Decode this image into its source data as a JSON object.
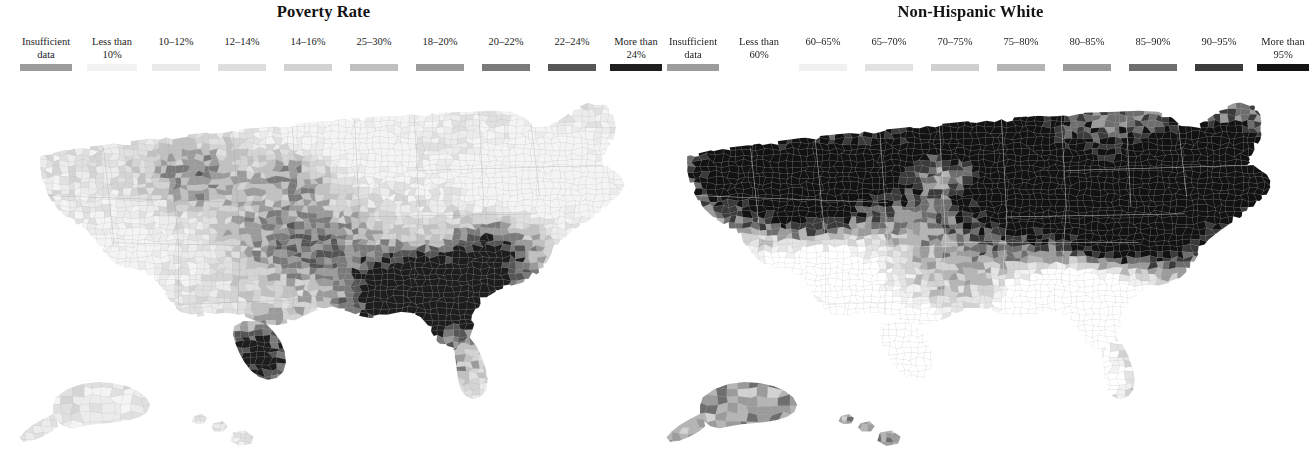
{
  "figure": {
    "width": 1294,
    "height": 449,
    "background": "#ffffff",
    "panel_count": 2
  },
  "panels": [
    {
      "id": "poverty-rate",
      "title": "Poverty Rate",
      "legend": {
        "items": [
          {
            "label": "Insufficient\ndata",
            "color": "#9c9c9c",
            "x": 46,
            "width": 78
          },
          {
            "label": "Less than\n10%",
            "color": "#f2f2f2",
            "x": 112,
            "width": 64
          },
          {
            "label": "10–12%",
            "color": "#eaeaea",
            "x": 176,
            "width": 62
          },
          {
            "label": "12–14%",
            "color": "#dedede",
            "x": 242,
            "width": 62
          },
          {
            "label": "14–16%",
            "color": "#d2d2d2",
            "x": 308,
            "width": 62
          },
          {
            "label": "25–30%",
            "color": "#c0c0c0",
            "x": 374,
            "width": 62
          },
          {
            "label": "18–20%",
            "color": "#9a9a9a",
            "x": 440,
            "width": 62
          },
          {
            "label": "20–22%",
            "color": "#7a7a7a",
            "x": 506,
            "width": 62
          },
          {
            "label": "22–24%",
            "color": "#565656",
            "x": 572,
            "width": 62
          },
          {
            "label": "More than\n24%",
            "color": "#1f1f1f",
            "x": 636,
            "width": 66
          }
        ]
      }
    },
    {
      "id": "non-hispanic-white",
      "title": "Non-Hispanic White",
      "legend": {
        "items": [
          {
            "label": "Insufficient\ndata",
            "color": "#9c9c9c",
            "x": 46,
            "width": 78
          },
          {
            "label": "Less than\n60%",
            "color": "#ffffff",
            "x": 112,
            "width": 64
          },
          {
            "label": "60–65%",
            "color": "#f0f0f0",
            "x": 176,
            "width": 62
          },
          {
            "label": "65–70%",
            "color": "#e2e2e2",
            "x": 242,
            "width": 62
          },
          {
            "label": "70–75%",
            "color": "#d0d0d0",
            "x": 308,
            "width": 62
          },
          {
            "label": "75–80%",
            "color": "#b4b4b4",
            "x": 374,
            "width": 62
          },
          {
            "label": "80–85%",
            "color": "#9a9a9a",
            "x": 440,
            "width": 62
          },
          {
            "label": "85–90%",
            "color": "#6e6e6e",
            "x": 506,
            "width": 62
          },
          {
            "label": "90–95%",
            "color": "#3c3c3c",
            "x": 572,
            "width": 62
          },
          {
            "label": "More than\n95%",
            "color": "#141414",
            "x": 636,
            "width": 66
          }
        ]
      }
    }
  ],
  "chart_data": {
    "type": "heatmap",
    "subtype": "choropleth-map-pair",
    "geography": "United States counties (contiguous 48 states plus Alaska and Hawaii insets)",
    "legend_position": "top, above each map",
    "grid": false,
    "maps": [
      {
        "name": "Poverty Rate",
        "variable": "poverty_rate_percent",
        "unit": "%",
        "value_range": [
          0,
          30
        ],
        "bins": [
          {
            "label": "Insufficient data",
            "color": "#9c9c9c",
            "share_of_counties": 0.005
          },
          {
            "label": "Less than 10%",
            "color": "#f2f2f2",
            "range": [
              0,
              10
            ],
            "share_of_counties": 0.17
          },
          {
            "label": "10–12%",
            "color": "#eaeaea",
            "range": [
              10,
              12
            ],
            "share_of_counties": 0.14
          },
          {
            "label": "12–14%",
            "color": "#dedede",
            "range": [
              12,
              14
            ],
            "share_of_counties": 0.15
          },
          {
            "label": "14–16%",
            "color": "#d2d2d2",
            "range": [
              14,
              16
            ],
            "share_of_counties": 0.14
          },
          {
            "label": "25–30%",
            "color": "#c0c0c0",
            "range": [
              25,
              30
            ],
            "share_of_counties": 0.12
          },
          {
            "label": "18–20%",
            "color": "#9a9a9a",
            "range": [
              18,
              20
            ],
            "share_of_counties": 0.1
          },
          {
            "label": "20–22%",
            "color": "#7a7a7a",
            "range": [
              20,
              22
            ],
            "share_of_counties": 0.07
          },
          {
            "label": "22–24%",
            "color": "#565656",
            "range": [
              22,
              24
            ],
            "share_of_counties": 0.05
          },
          {
            "label": "More than 24%",
            "color": "#1f1f1f",
            "range": [
              24,
              100
            ],
            "share_of_counties": 0.045
          }
        ],
        "spatial_pattern": "Light (low poverty) across the Upper Midwest, Great Plains, Northeast corridor and Mountain West; darker (high poverty) clusters in Appalachia, the Mississippi Delta, the Deep South Black Belt, south Texas along the Rio Grande, and Native American reservation counties in the Dakotas, Arizona and New Mexico.",
        "overall_tone": "light"
      },
      {
        "name": "Non-Hispanic White",
        "variable": "non_hispanic_white_percent",
        "unit": "%",
        "value_range": [
          0,
          100
        ],
        "bins": [
          {
            "label": "Insufficient data",
            "color": "#9c9c9c",
            "share_of_counties": 0.005
          },
          {
            "label": "Less than 60%",
            "color": "#ffffff",
            "range": [
              0,
              60
            ],
            "share_of_counties": 0.16
          },
          {
            "label": "60–65%",
            "color": "#f0f0f0",
            "range": [
              60,
              65
            ],
            "share_of_counties": 0.05
          },
          {
            "label": "65–70%",
            "color": "#e2e2e2",
            "range": [
              65,
              70
            ],
            "share_of_counties": 0.05
          },
          {
            "label": "70–75%",
            "color": "#d0d0d0",
            "range": [
              70,
              75
            ],
            "share_of_counties": 0.06
          },
          {
            "label": "75–80%",
            "color": "#b4b4b4",
            "range": [
              75,
              80
            ],
            "share_of_counties": 0.07
          },
          {
            "label": "80–85%",
            "color": "#9a9a9a",
            "range": [
              80,
              85
            ],
            "share_of_counties": 0.09
          },
          {
            "label": "85–90%",
            "color": "#6e6e6e",
            "range": [
              85,
              90
            ],
            "share_of_counties": 0.12
          },
          {
            "label": "90–95%",
            "color": "#3c3c3c",
            "range": [
              90,
              95
            ],
            "share_of_counties": 0.17
          },
          {
            "label": "More than 95%",
            "color": "#141414",
            "range": [
              95,
              100
            ],
            "share_of_counties": 0.22
          }
        ],
        "spatial_pattern": "Very dark (overwhelmingly non-Hispanic White) across the Upper Midwest, Northern Plains, Appalachia, New England and the Mountain West; light (low share) across the Deep South Black Belt, the Mississippi Delta, south and west Texas, New Mexico, southern Arizona and south Florida.",
        "overall_tone": "dark"
      }
    ]
  }
}
